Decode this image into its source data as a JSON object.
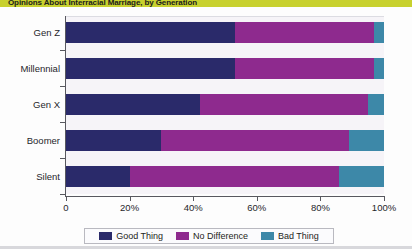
{
  "title": "Opinions About Interracial Marriage, by Generation",
  "title_bar_color": "#c8d12e",
  "chart_data": {
    "type": "bar",
    "orientation": "horizontal",
    "stacked": true,
    "stack_mode": "percent",
    "title": "Opinions About Interracial Marriage, by Generation",
    "xlabel": "",
    "ylabel": "",
    "xlim": [
      0,
      100
    ],
    "grid": false,
    "legend_position": "bottom",
    "categories": [
      "Gen Z",
      "Millennial",
      "Gen X",
      "Boomer",
      "Silent"
    ],
    "xtick_labels": [
      "0",
      "20%",
      "40%",
      "60%",
      "80%",
      "100%"
    ],
    "xtick_values": [
      0,
      20,
      40,
      60,
      80,
      100
    ],
    "series": [
      {
        "name": "Good Thing",
        "color": "#2a2a6a",
        "values": [
          53,
          53,
          42,
          30,
          20
        ]
      },
      {
        "name": "No Difference",
        "color": "#8e2a8e",
        "values": [
          44,
          44,
          53,
          59,
          66
        ]
      },
      {
        "name": "Bad Thing",
        "color": "#3d88a8",
        "values": [
          3,
          3,
          5,
          11,
          14
        ]
      }
    ]
  },
  "legend": {
    "items": [
      {
        "label": "Good Thing",
        "color": "#2a2a6a"
      },
      {
        "label": "No Difference",
        "color": "#8e2a8e"
      },
      {
        "label": "Bad Thing",
        "color": "#3d88a8"
      }
    ]
  }
}
